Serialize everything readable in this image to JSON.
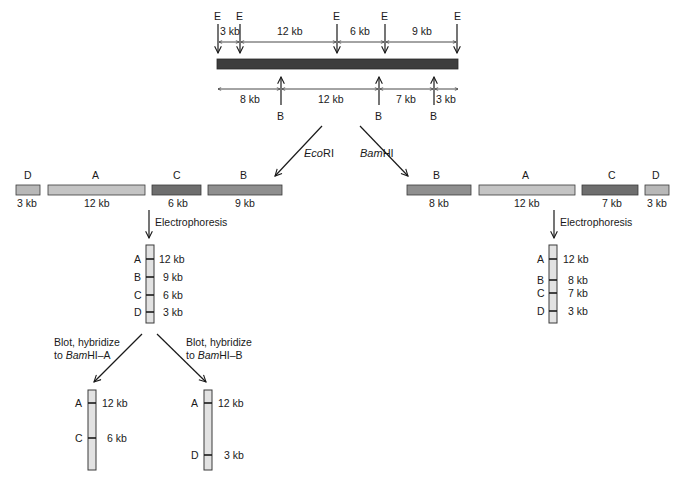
{
  "colors": {
    "dna": "#3d3d3d",
    "frag_light": "#c4c4c4",
    "frag_mid": "#8f8f8f",
    "frag_dark": "#6e6e6e",
    "lane": "#e2e2e2",
    "ink": "#1a1a1a"
  },
  "top_map": {
    "ecori_site_label": "E",
    "bamhi_site_label": "B",
    "ecori_segments": [
      "3 kb",
      "12 kb",
      "6 kb",
      "9 kb"
    ],
    "bamhi_segments": [
      "8 kb",
      "12 kb",
      "7 kb",
      "3 kb"
    ]
  },
  "branches": {
    "left_enzyme_prefix": "Eco",
    "left_enzyme_suffix": "RI",
    "right_enzyme_prefix": "Bam",
    "right_enzyme_suffix": "HI"
  },
  "ecori_fragments": [
    {
      "name": "D",
      "size": "3 kb"
    },
    {
      "name": "A",
      "size": "12 kb"
    },
    {
      "name": "C",
      "size": "6 kb"
    },
    {
      "name": "B",
      "size": "9 kb"
    }
  ],
  "bamhi_fragments": [
    {
      "name": "B",
      "size": "8 kb"
    },
    {
      "name": "A",
      "size": "12 kb"
    },
    {
      "name": "C",
      "size": "7 kb"
    },
    {
      "name": "D",
      "size": "3 kb"
    }
  ],
  "electrophoresis_label": "Electrophoresis",
  "ecori_gel": [
    {
      "name": "A",
      "size": "12 kb"
    },
    {
      "name": "B",
      "size": "9 kb"
    },
    {
      "name": "C",
      "size": "6 kb"
    },
    {
      "name": "D",
      "size": "3 kb"
    }
  ],
  "bamhi_gel": [
    {
      "name": "A",
      "size": "12 kb"
    },
    {
      "name": "B",
      "size": "8 kb"
    },
    {
      "name": "C",
      "size": "7 kb"
    },
    {
      "name": "D",
      "size": "3 kb"
    }
  ],
  "blots": [
    {
      "line1": "Blot, hybridize",
      "line2_prefix": "to ",
      "line2_italic": "Bam",
      "line2_suffix": "HI–A",
      "bands": [
        {
          "name": "A",
          "size": "12 kb"
        },
        {
          "name": "C",
          "size": "6 kb"
        }
      ]
    },
    {
      "line1": "Blot, hybridize",
      "line2_prefix": "to ",
      "line2_italic": "Bam",
      "line2_suffix": "HI–B",
      "bands": [
        {
          "name": "A",
          "size": "12 kb"
        },
        {
          "name": "D",
          "size": "3 kb"
        }
      ]
    }
  ]
}
